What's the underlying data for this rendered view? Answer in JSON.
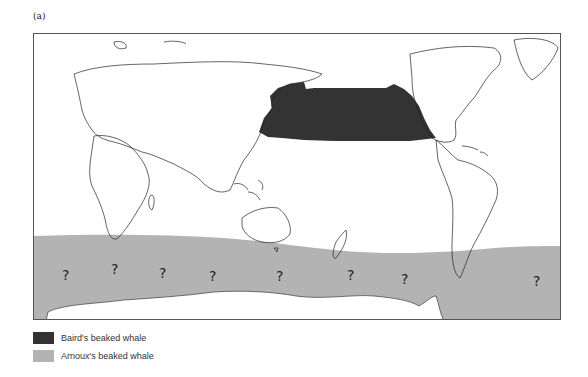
{
  "figure": {
    "panel_label": "(a)",
    "map_type": "Pacific-centred world map",
    "uncertainty_marker": "?",
    "question_marks": [
      {
        "x": 28,
        "y": 246
      },
      {
        "x": 77,
        "y": 240
      },
      {
        "x": 125,
        "y": 244
      },
      {
        "x": 175,
        "y": 247
      },
      {
        "x": 242,
        "y": 247
      },
      {
        "x": 313,
        "y": 246
      },
      {
        "x": 367,
        "y": 250
      },
      {
        "x": 499,
        "y": 252
      }
    ]
  },
  "legend": {
    "items": [
      {
        "label": "Baird's beaked whale",
        "color": "#333333"
      },
      {
        "label": "Arnoux's beaked whale",
        "color": "#b3b3b3"
      }
    ]
  },
  "colors": {
    "baird": "#333333",
    "arnoux": "#b3b3b3",
    "coastline": "#222222",
    "frame": "#555555"
  }
}
